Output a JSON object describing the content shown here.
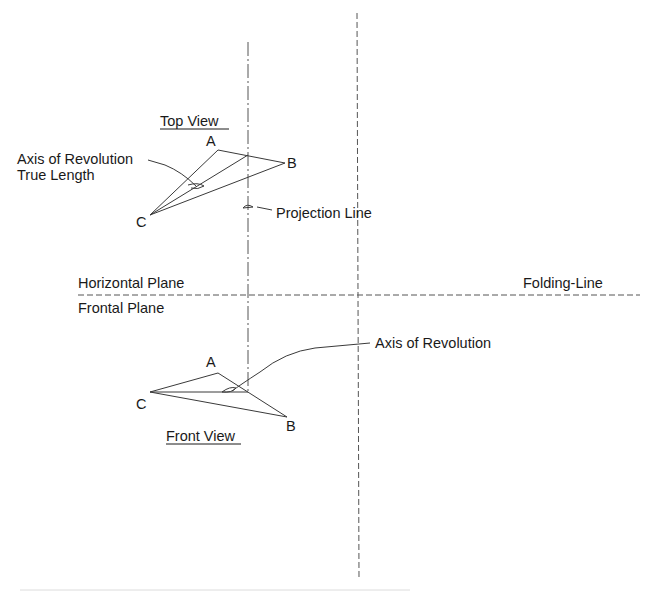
{
  "labels": {
    "top_view": "Top View",
    "front_view": "Front View",
    "axis_true_length_1": "Axis of Revolution",
    "axis_true_length_2": "True Length",
    "projection_line": "Projection Line",
    "horizontal_plane": "Horizontal Plane",
    "frontal_plane": "Frontal Plane",
    "folding_line": "Folding-Line",
    "axis_of_revolution": "Axis of Revolution"
  },
  "points": {
    "top": {
      "A": "A",
      "B": "B",
      "C": "C"
    },
    "front": {
      "A": "A",
      "B": "B",
      "C": "C"
    }
  },
  "colors": {
    "line": "#3a3a3a",
    "text": "#1a1a1a",
    "background": "#ffffff"
  }
}
